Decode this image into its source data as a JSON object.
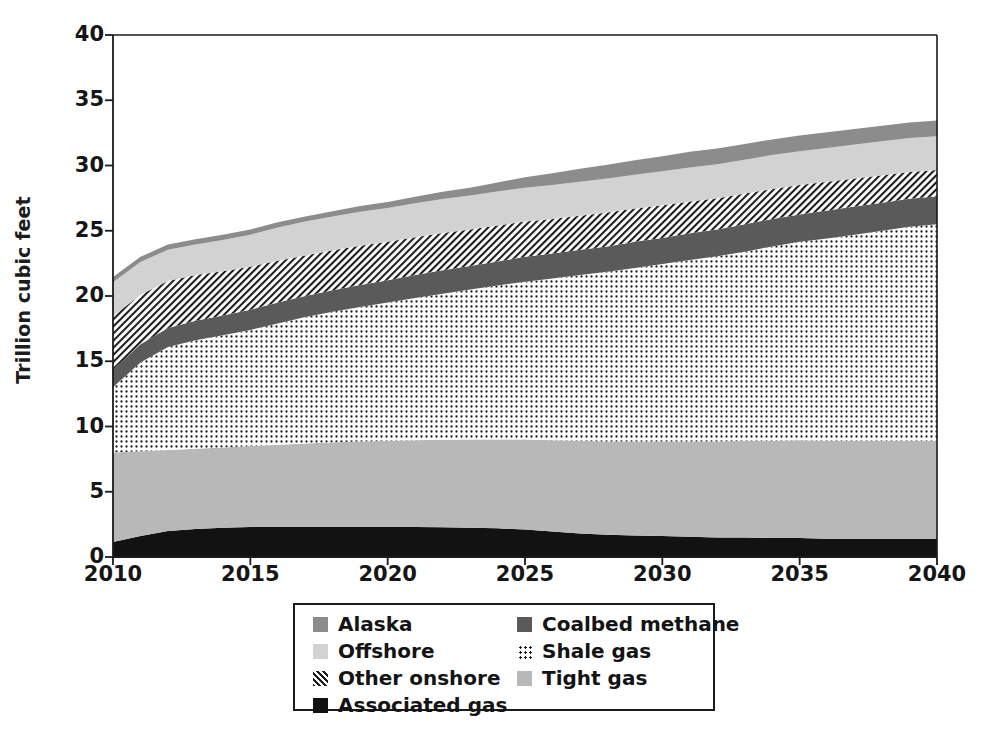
{
  "chart_data": {
    "type": "area",
    "stacked": true,
    "title": "",
    "xlabel": "",
    "ylabel": "Trillion cubic feet",
    "xlim": [
      2010,
      2040
    ],
    "ylim": [
      0,
      40
    ],
    "grid": false,
    "legend_position": "bottom",
    "ytick_labels": [
      "0",
      "5",
      "10",
      "15",
      "20",
      "25",
      "30",
      "35",
      "40"
    ],
    "ytick_values": [
      0,
      5,
      10,
      15,
      20,
      25,
      30,
      35,
      40
    ],
    "xtick_labels": [
      "2010",
      "2015",
      "2020",
      "2025",
      "2030",
      "2035",
      "2040"
    ],
    "xtick_values": [
      2010,
      2015,
      2020,
      2025,
      2030,
      2035,
      2040
    ],
    "x": [
      2010,
      2011,
      2012,
      2013,
      2014,
      2015,
      2016,
      2017,
      2018,
      2019,
      2020,
      2021,
      2022,
      2023,
      2024,
      2025,
      2026,
      2027,
      2028,
      2029,
      2030,
      2031,
      2032,
      2033,
      2034,
      2035,
      2036,
      2037,
      2038,
      2039,
      2040
    ],
    "stack_order_bottom_to_top": [
      "Associated gas",
      "Tight gas",
      "Shale gas",
      "Coalbed methane",
      "Other onshore",
      "Offshore",
      "Alaska"
    ],
    "series": [
      {
        "name": "Associated gas",
        "color": "#121212",
        "pattern": "solid",
        "values": [
          1.15,
          1.6,
          2.0,
          2.15,
          2.25,
          2.3,
          2.3,
          2.3,
          2.3,
          2.3,
          2.3,
          2.3,
          2.28,
          2.25,
          2.2,
          2.1,
          1.95,
          1.8,
          1.7,
          1.65,
          1.6,
          1.55,
          1.5,
          1.5,
          1.45,
          1.45,
          1.4,
          1.4,
          1.4,
          1.4,
          1.4
        ]
      },
      {
        "name": "Tight gas",
        "color": "#b8b8b8",
        "pattern": "solid",
        "values": [
          6.85,
          6.5,
          6.2,
          6.15,
          6.15,
          6.2,
          6.3,
          6.4,
          6.5,
          6.55,
          6.6,
          6.65,
          6.7,
          6.75,
          6.8,
          6.9,
          7.0,
          7.1,
          7.15,
          7.2,
          7.25,
          7.3,
          7.35,
          7.4,
          7.45,
          7.5,
          7.5,
          7.5,
          7.5,
          7.5,
          7.5
        ]
      },
      {
        "name": "Shale gas",
        "color": "#ffffff",
        "pattern": "dots",
        "values": [
          5.0,
          6.8,
          7.9,
          8.3,
          8.6,
          8.9,
          9.3,
          9.7,
          10.0,
          10.3,
          10.6,
          10.9,
          11.2,
          11.5,
          11.8,
          12.1,
          12.4,
          12.7,
          13.0,
          13.3,
          13.6,
          13.9,
          14.2,
          14.5,
          14.9,
          15.2,
          15.5,
          15.8,
          16.1,
          16.4,
          16.6
        ]
      },
      {
        "name": "Coalbed methane",
        "color": "#5a5a5a",
        "pattern": "solid",
        "values": [
          1.35,
          1.4,
          1.45,
          1.5,
          1.5,
          1.55,
          1.6,
          1.6,
          1.65,
          1.7,
          1.7,
          1.75,
          1.8,
          1.8,
          1.85,
          1.9,
          1.9,
          1.95,
          1.95,
          2.0,
          2.0,
          2.05,
          2.05,
          2.1,
          2.1,
          2.1,
          2.15,
          2.15,
          2.15,
          2.15,
          2.15
        ]
      },
      {
        "name": "Other onshore",
        "color": "#1d1d1d",
        "pattern": "diagonal-hatch",
        "values": [
          4.1,
          3.8,
          3.6,
          3.5,
          3.4,
          3.3,
          3.2,
          3.1,
          3.05,
          3.0,
          2.95,
          2.9,
          2.85,
          2.8,
          2.75,
          2.7,
          2.65,
          2.6,
          2.6,
          2.55,
          2.5,
          2.45,
          2.4,
          2.35,
          2.3,
          2.25,
          2.2,
          2.15,
          2.1,
          2.05,
          2.0
        ]
      },
      {
        "name": "Offshore",
        "color": "#d2d2d2",
        "pattern": "solid",
        "values": [
          2.6,
          2.5,
          2.4,
          2.35,
          2.4,
          2.45,
          2.55,
          2.6,
          2.6,
          2.6,
          2.6,
          2.6,
          2.6,
          2.6,
          2.6,
          2.6,
          2.6,
          2.6,
          2.6,
          2.6,
          2.6,
          2.6,
          2.6,
          2.6,
          2.6,
          2.6,
          2.6,
          2.6,
          2.6,
          2.6,
          2.6
        ]
      },
      {
        "name": "Alaska",
        "color": "#8c8c8c",
        "pattern": "solid",
        "values": [
          0.4,
          0.4,
          0.4,
          0.4,
          0.4,
          0.4,
          0.4,
          0.4,
          0.4,
          0.45,
          0.45,
          0.5,
          0.55,
          0.6,
          0.7,
          0.8,
          0.9,
          1.0,
          1.05,
          1.1,
          1.15,
          1.2,
          1.2,
          1.2,
          1.2,
          1.2,
          1.2,
          1.2,
          1.2,
          1.2,
          1.2
        ]
      }
    ],
    "totals": [
      21.45,
      23.0,
      23.95,
      24.45,
      24.7,
      25.1,
      25.65,
      26.1,
      26.5,
      26.9,
      27.2,
      27.6,
      27.98,
      28.3,
      28.75,
      29.1,
      29.4,
      29.75,
      30.05,
      30.4,
      30.7,
      31.05,
      31.3,
      31.65,
      32.0,
      32.3,
      32.55,
      32.8,
      33.05,
      33.3,
      33.45
    ]
  },
  "legend": {
    "columns": [
      {
        "items": [
          {
            "label": "Alaska",
            "swatch": "sw-alaska",
            "icon": "square-swatch-icon"
          },
          {
            "label": "Offshore",
            "swatch": "sw-offshore",
            "icon": "square-swatch-icon"
          },
          {
            "label": "Other onshore",
            "swatch": "sw-other",
            "icon": "hatch-swatch-icon"
          },
          {
            "label": "Associated gas",
            "swatch": "sw-associated",
            "icon": "square-swatch-icon"
          }
        ]
      },
      {
        "items": [
          {
            "label": "Coalbed methane",
            "swatch": "sw-coalbed",
            "icon": "square-swatch-icon"
          },
          {
            "label": "Shale gas",
            "swatch": "sw-shale",
            "icon": "dot-swatch-icon"
          },
          {
            "label": "Tight gas",
            "swatch": "sw-tight",
            "icon": "square-swatch-icon"
          }
        ]
      }
    ]
  }
}
